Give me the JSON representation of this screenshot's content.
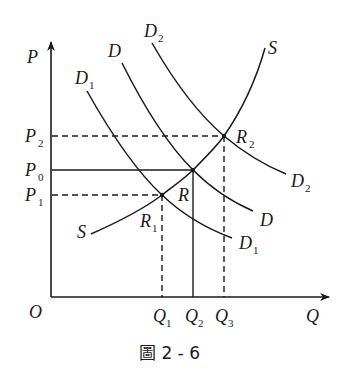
{
  "diagram": {
    "type": "supply-demand",
    "axes": {
      "y_label": "P",
      "x_label": "Q",
      "origin_label": "O"
    },
    "price_levels": [
      {
        "id": "P2",
        "base": "P",
        "sub": "2",
        "line": "dashed"
      },
      {
        "id": "P0",
        "base": "P",
        "sub": "0",
        "line": "solid"
      },
      {
        "id": "P1",
        "base": "P",
        "sub": "1",
        "line": "dashed"
      }
    ],
    "quantity_levels": [
      {
        "id": "Q1",
        "base": "Q",
        "sub": "1",
        "line": "dashed"
      },
      {
        "id": "Q2",
        "base": "Q",
        "sub": "2",
        "line": "solid"
      },
      {
        "id": "Q3",
        "base": "Q",
        "sub": "3",
        "line": "dashed"
      }
    ],
    "curves": [
      {
        "id": "S",
        "label": "S",
        "kind": "supply"
      },
      {
        "id": "D1",
        "base": "D",
        "sub": "1",
        "kind": "demand"
      },
      {
        "id": "D",
        "label": "D",
        "kind": "demand"
      },
      {
        "id": "D2",
        "base": "D",
        "sub": "2",
        "kind": "demand"
      }
    ],
    "equilibria": [
      {
        "id": "R1",
        "base": "R",
        "sub": "1",
        "price": "P1",
        "quantity": "Q1"
      },
      {
        "id": "R",
        "label": "R",
        "price": "P0",
        "quantity": "Q2"
      },
      {
        "id": "R2",
        "base": "R",
        "sub": "2",
        "price": "P2",
        "quantity": "Q3"
      }
    ],
    "caption": "圖 2 - 6",
    "colors": {
      "ink": "#1a1a1a",
      "background": "#ffffff"
    }
  }
}
